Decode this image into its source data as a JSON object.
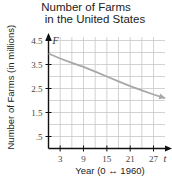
{
  "chart_data": {
    "type": "line",
    "title": "Number of Farms in the United States",
    "title_lines": [
      "Number of Farms",
      "in the United States"
    ],
    "xlabel": "Year (0 ↔ 1960)",
    "ylabel": "Number of Farms (in millions)",
    "x_variable": "t",
    "y_variable": "F",
    "xlim": [
      0,
      30
    ],
    "ylim": [
      0,
      4.5
    ],
    "x_ticks": [
      3,
      9,
      15,
      21,
      27
    ],
    "x_tick_labels": [
      "3",
      "9",
      "15",
      "21",
      "27"
    ],
    "y_ticks": [
      0.5,
      1.5,
      2.5,
      3.5,
      4.5
    ],
    "y_tick_labels": [
      ".5",
      "1.5",
      "2.5",
      "3.5",
      "4.5"
    ],
    "grid": true,
    "x_grid_step": 3,
    "y_grid_step": 0.5,
    "series": [
      {
        "name": "Number of Farms",
        "color": "#a8a8a8",
        "arrow_end": true,
        "x": [
          0,
          3,
          6,
          9,
          12,
          15,
          18,
          21,
          24,
          27,
          30
        ],
        "values": [
          3.96,
          3.75,
          3.57,
          3.4,
          3.2,
          3.0,
          2.8,
          2.6,
          2.42,
          2.25,
          2.1
        ]
      }
    ]
  }
}
